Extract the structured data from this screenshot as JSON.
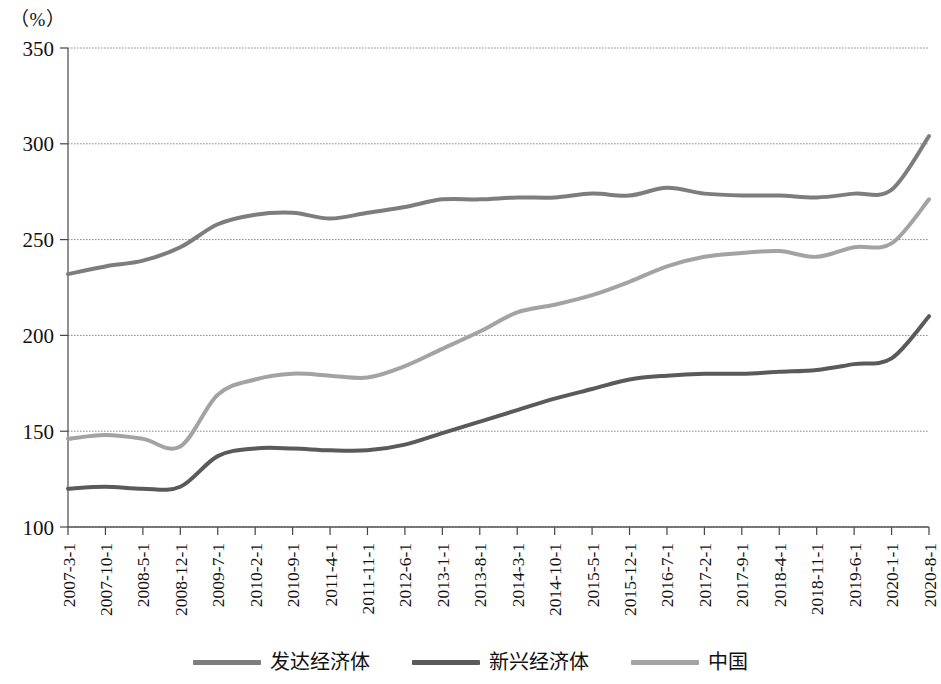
{
  "unit_label": "（%）",
  "legend": {
    "items": [
      {
        "label": "发达经济体",
        "color": "#7d7d7d",
        "key": "developed"
      },
      {
        "label": "新兴经济体",
        "color": "#5a5a5a",
        "key": "emerging"
      },
      {
        "label": "中国",
        "color": "#a3a3a3",
        "key": "china"
      }
    ]
  },
  "axis": {
    "y_ticks": [
      "100",
      "150",
      "200",
      "250",
      "300",
      "350"
    ],
    "x_ticks": [
      "2007-3-1",
      "2007-10-1",
      "2008-5-1",
      "2008-12-1",
      "2009-7-1",
      "2010-2-1",
      "2010-9-1",
      "2011-4-1",
      "2011-11-1",
      "2012-6-1",
      "2013-1-1",
      "2013-8-1",
      "2014-3-1",
      "2014-10-1",
      "2015-5-1",
      "2015-12-1",
      "2016-7-1",
      "2017-2-1",
      "2017-9-1",
      "2018-4-1",
      "2018-11-1",
      "2019-6-1",
      "2020-1-1",
      "2020-8-1"
    ]
  },
  "chart_data": {
    "type": "line",
    "title": "",
    "xlabel": "",
    "ylabel": "（%）",
    "ylim": [
      100,
      350
    ],
    "ytick_step": 50,
    "grid": true,
    "legend_position": "bottom",
    "x": [
      "2007-3-1",
      "2007-10-1",
      "2008-5-1",
      "2008-12-1",
      "2009-7-1",
      "2010-2-1",
      "2010-9-1",
      "2011-4-1",
      "2011-11-1",
      "2012-6-1",
      "2013-1-1",
      "2013-8-1",
      "2014-3-1",
      "2014-10-1",
      "2015-5-1",
      "2015-12-1",
      "2016-7-1",
      "2017-2-1",
      "2017-9-1",
      "2018-4-1",
      "2018-11-1",
      "2019-6-1",
      "2020-1-1",
      "2020-8-1"
    ],
    "series": [
      {
        "name": "发达经济体",
        "color": "#7d7d7d",
        "values": [
          232,
          236,
          239,
          246,
          258,
          263,
          264,
          261,
          264,
          267,
          271,
          271,
          272,
          272,
          274,
          273,
          277,
          274,
          273,
          273,
          272,
          274,
          276,
          304
        ]
      },
      {
        "name": "新兴经济体",
        "color": "#5a5a5a",
        "values": [
          120,
          121,
          120,
          121,
          137,
          141,
          141,
          140,
          140,
          143,
          149,
          155,
          161,
          167,
          172,
          177,
          179,
          180,
          180,
          181,
          182,
          185,
          188,
          210
        ]
      },
      {
        "name": "中国",
        "color": "#a3a3a3",
        "values": [
          146,
          148,
          146,
          142,
          169,
          177,
          180,
          179,
          178,
          184,
          193,
          202,
          212,
          216,
          221,
          228,
          236,
          241,
          243,
          244,
          241,
          246,
          248,
          271
        ]
      }
    ]
  },
  "plot_geometry": {
    "left": 68,
    "right": 929,
    "top": 48,
    "bottom": 527
  }
}
